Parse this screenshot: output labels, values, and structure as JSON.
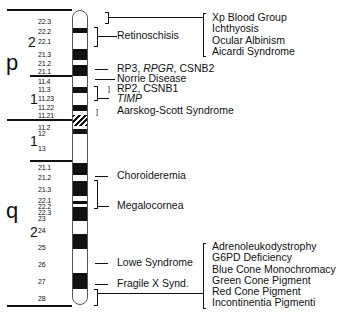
{
  "diagram": {
    "type": "chromosome-ideogram",
    "arms": {
      "p": "p",
      "q": "q"
    },
    "regions": [
      {
        "arm": "p",
        "label": "2"
      },
      {
        "arm": "p",
        "label": "1"
      },
      {
        "arm": "q",
        "label": "1"
      },
      {
        "arm": "q",
        "label": "2"
      }
    ],
    "band_labels": {
      "p": [
        "22.3",
        "22.2",
        "22.1",
        "21.3",
        "21.2",
        "21.1",
        "11.4",
        "11.3",
        "11.23",
        "11.22",
        "11.21"
      ],
      "q": [
        "11.2",
        "12",
        "13",
        "21.1",
        "21.2",
        "21.3",
        "22.1",
        "22.2",
        "22.3",
        "23",
        "24",
        "25",
        "26",
        "27",
        "28"
      ]
    },
    "disease_labels": {
      "top_group": [
        "Xp Blood Group",
        "Ichthyosis",
        "Ocular Albinism",
        "Aicardi Syndrome"
      ],
      "retinoschisis": "Retinoschisis",
      "rp3": {
        "pre": "RP3, ",
        "italic": "RPGR",
        "post": ", CSNB2"
      },
      "norrie": "Norrie Disease",
      "rp2": "RP2, CSNB1",
      "timp": "TIMP",
      "aarskog": "Aarskog-Scott Syndrome",
      "choroideremia": "Choroideremia",
      "megalocornea": "Megalocornea",
      "lowe": "Lowe Syndrome",
      "fragile_x": "Fragile X Synd.",
      "bottom_group": [
        "Adrenoleukodystrophy",
        "G6PD Deficiency",
        "Blue Cone Monochromacy",
        "Green Cone Pigment",
        "Red Cone Pigment",
        "Incontinentia Pigmenti"
      ]
    },
    "colors": {
      "ink": "#111111",
      "background": "#ffffff"
    }
  }
}
